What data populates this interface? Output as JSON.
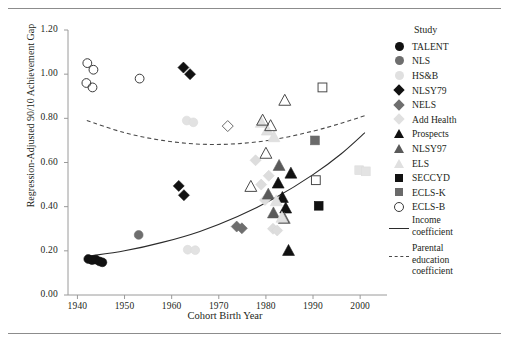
{
  "figure": {
    "rule_top": "horizontal-rule",
    "rule_bottom": "horizontal-rule"
  },
  "chart_data": {
    "type": "scatter",
    "title": "",
    "xlabel": "Cohort Birth Year",
    "ylabel": "Regression-Adjusted 90/10 Achievement Gap",
    "xlim": [
      1938,
      2004
    ],
    "ylim": [
      0.0,
      1.2
    ],
    "xticks": [
      1940,
      1950,
      1960,
      1970,
      1980,
      1990,
      2000
    ],
    "yticks": [
      "0.00",
      "0.20",
      "0.40",
      "0.60",
      "0.80",
      "1.00",
      "1.20"
    ],
    "grid": false,
    "legend_title": "Study",
    "legend_position": "right",
    "series": [
      {
        "name": "TALENT",
        "marker": "circle",
        "fill": "#111111",
        "stroke": "#111111",
        "points": [
          {
            "x": 1942.3,
            "y": 0.163
          },
          {
            "x": 1943.1,
            "y": 0.158
          },
          {
            "x": 1943.9,
            "y": 0.16
          },
          {
            "x": 1944.7,
            "y": 0.152
          },
          {
            "x": 1945.3,
            "y": 0.148
          }
        ]
      },
      {
        "name": "NLS",
        "marker": "circle",
        "fill": "#6e6e6e",
        "stroke": "#6e6e6e",
        "points": [
          {
            "x": 1953.0,
            "y": 0.272
          }
        ]
      },
      {
        "name": "HS&B",
        "marker": "circle",
        "fill": "#e2e2e2",
        "stroke": "#dcdcdc",
        "points": [
          {
            "x": 1963.2,
            "y": 0.79
          },
          {
            "x": 1964.6,
            "y": 0.782
          },
          {
            "x": 1963.4,
            "y": 0.205
          },
          {
            "x": 1965.0,
            "y": 0.203
          }
        ]
      },
      {
        "name": "NLSY79",
        "marker": "diamond",
        "fill": "#111111",
        "stroke": "#111111",
        "points": [
          {
            "x": 1962.5,
            "y": 1.03
          },
          {
            "x": 1963.9,
            "y": 1.0
          },
          {
            "x": 1961.5,
            "y": 0.494
          },
          {
            "x": 1962.6,
            "y": 0.452
          }
        ]
      },
      {
        "name": "NELS",
        "marker": "diamond",
        "fill": "#6e6e6e",
        "stroke": "#6e6e6e",
        "points": [
          {
            "x": 1973.8,
            "y": 0.31
          },
          {
            "x": 1974.9,
            "y": 0.302
          }
        ]
      },
      {
        "name": "Add Health",
        "marker": "diamond",
        "fill": "#dddddd",
        "stroke": "#d6d6d6",
        "points": [
          {
            "x": 1977.8,
            "y": 0.61
          },
          {
            "x": 1979.0,
            "y": 0.5
          },
          {
            "x": 1979.8,
            "y": 0.43
          },
          {
            "x": 1980.6,
            "y": 0.54
          },
          {
            "x": 1981.5,
            "y": 0.3
          },
          {
            "x": 1982.4,
            "y": 0.292
          }
        ]
      },
      {
        "name": "Prospects",
        "marker": "triangle",
        "fill": "#111111",
        "stroke": "#111111",
        "points": [
          {
            "x": 1982.6,
            "y": 0.505
          },
          {
            "x": 1983.5,
            "y": 0.44
          },
          {
            "x": 1984.2,
            "y": 0.392
          },
          {
            "x": 1984.8,
            "y": 0.2
          },
          {
            "x": 1985.3,
            "y": 0.55
          }
        ]
      },
      {
        "name": "NLSY97",
        "marker": "triangle",
        "fill": "#5a5a5a",
        "stroke": "#5a5a5a",
        "points": [
          {
            "x": 1980.5,
            "y": 0.455
          },
          {
            "x": 1981.6,
            "y": 0.37
          },
          {
            "x": 1982.8,
            "y": 0.585
          },
          {
            "x": 1983.9,
            "y": 0.345
          }
        ]
      },
      {
        "name": "ELS",
        "marker": "triangle",
        "fill": "#e0e0e0",
        "stroke": "#dadada",
        "points": [
          {
            "x": 1979.0,
            "y": 0.78
          },
          {
            "x": 1980.3,
            "y": 0.745
          },
          {
            "x": 1981.7,
            "y": 0.715
          },
          {
            "x": 1982.2,
            "y": 0.425
          },
          {
            "x": 1983.4,
            "y": 0.35
          }
        ]
      },
      {
        "name": "SECCYD",
        "marker": "square",
        "fill": "#111111",
        "stroke": "#111111",
        "points": [
          {
            "x": 1991.2,
            "y": 0.404
          }
        ]
      },
      {
        "name": "ECLS-K",
        "marker": "square",
        "fill": "#6a6a6a",
        "stroke": "#6a6a6a",
        "points": [
          {
            "x": 1990.4,
            "y": 0.7
          }
        ]
      },
      {
        "name": "ECLS-B",
        "marker": "circle-open",
        "fill": "none",
        "stroke": "#3a3a3a",
        "points": [
          {
            "x": 1942.1,
            "y": 1.05
          },
          {
            "x": 1943.4,
            "y": 1.02
          },
          {
            "x": 1941.9,
            "y": 0.96
          },
          {
            "x": 1943.2,
            "y": 0.94
          },
          {
            "x": 1953.2,
            "y": 0.98
          }
        ]
      },
      {
        "name": "open-squares",
        "marker": "square-open",
        "fill": "none",
        "stroke": "#4a4a4a",
        "points": [
          {
            "x": 1992.0,
            "y": 0.94
          },
          {
            "x": 1990.6,
            "y": 0.52
          }
        ]
      },
      {
        "name": "open-triangles",
        "marker": "triangle-open",
        "fill": "none",
        "stroke": "#4a4a4a",
        "points": [
          {
            "x": 1984.0,
            "y": 0.88
          },
          {
            "x": 1979.3,
            "y": 0.79
          },
          {
            "x": 1981.0,
            "y": 0.765
          },
          {
            "x": 1980.0,
            "y": 0.64
          },
          {
            "x": 1976.8,
            "y": 0.49
          }
        ]
      },
      {
        "name": "open-diamond",
        "marker": "diamond-open",
        "fill": "none",
        "stroke": "#6a6a6a",
        "points": [
          {
            "x": 1971.9,
            "y": 0.765
          }
        ]
      },
      {
        "name": "pale-squares",
        "marker": "square",
        "fill": "#e3e3e3",
        "stroke": "#dcdcdc",
        "points": [
          {
            "x": 1999.8,
            "y": 0.565
          },
          {
            "x": 2001.2,
            "y": 0.56
          }
        ]
      }
    ],
    "curves": [
      {
        "name": "Income coefficient",
        "style": "solid",
        "color": "#2b2b2b",
        "points": [
          {
            "x": 1942,
            "y": 0.175
          },
          {
            "x": 1950,
            "y": 0.2
          },
          {
            "x": 1958,
            "y": 0.238
          },
          {
            "x": 1966,
            "y": 0.288
          },
          {
            "x": 1974,
            "y": 0.355
          },
          {
            "x": 1982,
            "y": 0.44
          },
          {
            "x": 1990,
            "y": 0.545
          },
          {
            "x": 1996,
            "y": 0.64
          },
          {
            "x": 2001,
            "y": 0.735
          }
        ]
      },
      {
        "name": "Parental education coefficient",
        "style": "dashed",
        "color": "#4a4a4a",
        "points": [
          {
            "x": 1942,
            "y": 0.79
          },
          {
            "x": 1950,
            "y": 0.735
          },
          {
            "x": 1958,
            "y": 0.7
          },
          {
            "x": 1966,
            "y": 0.683
          },
          {
            "x": 1974,
            "y": 0.685
          },
          {
            "x": 1982,
            "y": 0.705
          },
          {
            "x": 1990,
            "y": 0.742
          },
          {
            "x": 1996,
            "y": 0.778
          },
          {
            "x": 2001,
            "y": 0.812
          }
        ]
      }
    ]
  },
  "legend": {
    "title": "Study",
    "items": [
      {
        "label": "TALENT",
        "key": "circle",
        "color": "#111111"
      },
      {
        "label": "NLS",
        "key": "circle",
        "color": "#6e6e6e"
      },
      {
        "label": "HS&B",
        "key": "circle",
        "color": "#e0e0e0"
      },
      {
        "label": "NLSY79",
        "key": "diamond",
        "color": "#111111"
      },
      {
        "label": "NELS",
        "key": "diamond",
        "color": "#6e6e6e"
      },
      {
        "label": "Add Health",
        "key": "diamond",
        "color": "#e0e0e0"
      },
      {
        "label": "Prospects",
        "key": "triangle",
        "color": "#111111"
      },
      {
        "label": "NLSY97",
        "key": "triangle",
        "color": "#5a5a5a"
      },
      {
        "label": "ELS",
        "key": "triangle",
        "color": "#e0e0e0"
      },
      {
        "label": "SECCYD",
        "key": "square",
        "color": "#111111"
      },
      {
        "label": "ECLS-K",
        "key": "square",
        "color": "#6a6a6a"
      },
      {
        "label": "ECLS-B",
        "key": "circle-open",
        "color": "#3a3a3a"
      }
    ],
    "curve_items": [
      {
        "line1": "Income",
        "line2": "coefficient",
        "key": "line"
      },
      {
        "line1": "Parental",
        "line2": "education",
        "line3": "coefficient",
        "key": "dash"
      }
    ]
  }
}
